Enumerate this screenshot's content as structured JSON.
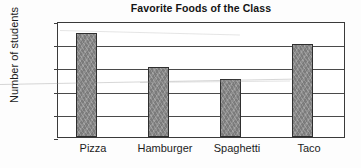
{
  "chart_data": {
    "type": "bar",
    "title": "Favorite Foods of the Class",
    "xlabel": "",
    "ylabel": "Number of students",
    "categories": [
      "Pizza",
      "Hamburger",
      "Spaghetti",
      "Taco"
    ],
    "values": [
      9,
      6,
      5,
      8
    ],
    "ylim": [
      0,
      10
    ],
    "ytick_labels": [
      "0",
      "2",
      "4",
      "6",
      "8",
      "10"
    ],
    "ytick_values": [
      0,
      2,
      4,
      6,
      8,
      10
    ],
    "grid": "horizontal",
    "legend": "none",
    "bar_color": "#878787",
    "bar_edge_color": "#2f2f2f",
    "axis_color": "#3a3a3a",
    "background": "#ffffff"
  }
}
